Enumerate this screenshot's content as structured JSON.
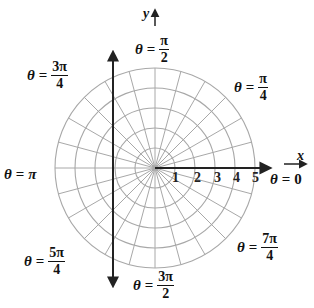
{
  "diagram": {
    "type": "polar-grid",
    "center": {
      "x": 155,
      "y": 168
    },
    "ring_spacing_px": 20,
    "rings": [
      1,
      2,
      3,
      4,
      5
    ],
    "ray_step_degrees": 15,
    "grid_color": "#a8a8a8",
    "axis_color": "#222222"
  },
  "axes": {
    "x_label": "x",
    "y_label": "y",
    "polar_axis_ticks": [
      "1",
      "2",
      "3",
      "4",
      "5"
    ]
  },
  "angle_labels": {
    "a0": {
      "theta": "θ",
      "eq": "=",
      "value": "0"
    },
    "a45": {
      "theta": "θ",
      "eq": "=",
      "num": "π",
      "den": "4"
    },
    "a90": {
      "theta": "θ",
      "eq": "=",
      "num": "π",
      "den": "2"
    },
    "a135": {
      "theta": "θ",
      "eq": "=",
      "num": "3π",
      "den": "4"
    },
    "a180": {
      "theta": "θ",
      "eq": "=",
      "value": "π"
    },
    "a225": {
      "theta": "θ",
      "eq": "=",
      "num": "5π",
      "den": "4"
    },
    "a270": {
      "theta": "θ",
      "eq": "=",
      "num": "3π",
      "den": "2"
    },
    "a315": {
      "theta": "θ",
      "eq": "=",
      "num": "7π",
      "den": "4"
    }
  }
}
